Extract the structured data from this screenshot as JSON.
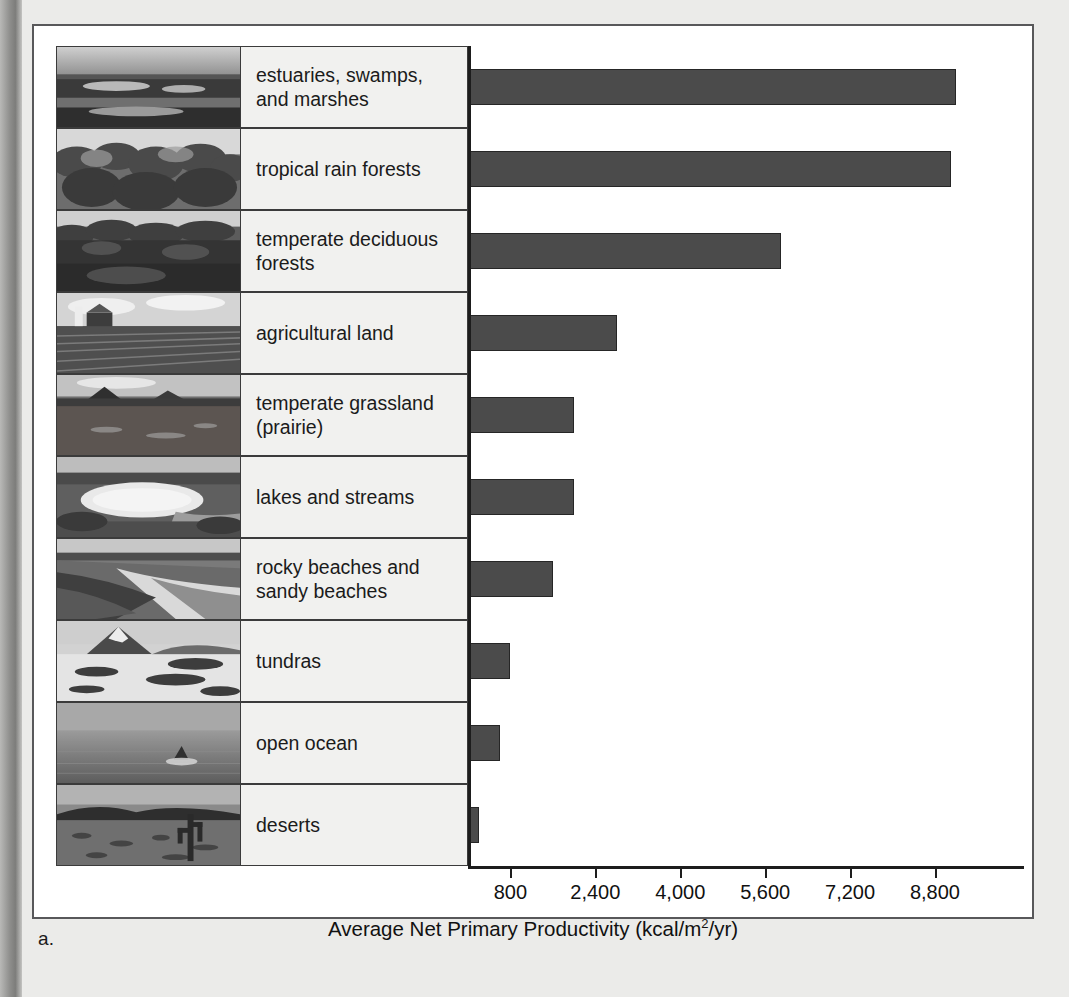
{
  "figure": {
    "caption": "a.",
    "panel_bg": "#ffffff",
    "bar_color": "#4b4b4b",
    "label_cell_bg": "#f1f1ef"
  },
  "chart_data": {
    "type": "bar",
    "orientation": "horizontal",
    "title": "",
    "xlabel": "Average Net Primary Productivity (kcal/m2/yr)",
    "xlabel_parts": {
      "main": "Average Net Primary Productivity (kcal/m",
      "sup": "2",
      "tail": "/yr)"
    },
    "ylabel": "",
    "categories": [
      "estuaries, swamps, and marshes",
      "tropical rain forests",
      "temperate deciduous forests",
      "agricultural land",
      "temperate grassland (prairie)",
      "lakes and streams",
      "rocky beaches and sandy beaches",
      "tundras",
      "open ocean",
      "deserts"
    ],
    "values": [
      9200,
      9100,
      5900,
      2800,
      2000,
      2000,
      1600,
      800,
      600,
      200
    ],
    "xticks": [
      800,
      2400,
      4000,
      5600,
      7200,
      8800
    ],
    "xtick_labels": [
      "800",
      "2,400",
      "4,000",
      "5,600",
      "7,200",
      "8,800"
    ],
    "xlim": [
      0,
      9950
    ],
    "grid": false,
    "legend": null
  },
  "rows": [
    {
      "label_line1": "estuaries, swamps,",
      "label_line2": "and marshes",
      "thumb": "estuary-marsh-photo"
    },
    {
      "label_line1": "tropical rain forests",
      "label_line2": "",
      "thumb": "rainforest-canopy-photo"
    },
    {
      "label_line1": "temperate deciduous",
      "label_line2": "forests",
      "thumb": "deciduous-forest-photo"
    },
    {
      "label_line1": "agricultural land",
      "label_line2": "",
      "thumb": "farm-field-photo"
    },
    {
      "label_line1": "temperate grassland",
      "label_line2": "(prairie)",
      "thumb": "prairie-photo"
    },
    {
      "label_line1": "lakes and streams",
      "label_line2": "",
      "thumb": "lake-stream-photo"
    },
    {
      "label_line1": "rocky beaches and",
      "label_line2": "sandy beaches",
      "thumb": "beach-photo"
    },
    {
      "label_line1": "tundras",
      "label_line2": "",
      "thumb": "tundra-mountain-photo"
    },
    {
      "label_line1": "open ocean",
      "label_line2": "",
      "thumb": "open-ocean-photo"
    },
    {
      "label_line1": "deserts",
      "label_line2": "",
      "thumb": "desert-cactus-photo"
    }
  ]
}
